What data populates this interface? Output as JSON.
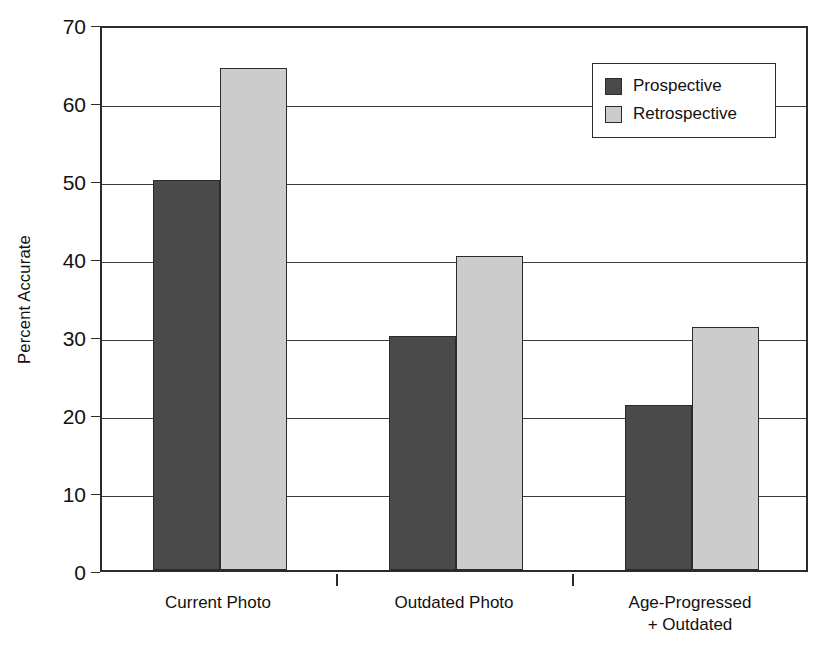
{
  "chart_data": {
    "type": "bar",
    "title": "",
    "subtitle": "",
    "xlabel": "",
    "ylabel": "Percent Accurate",
    "ylim": [
      0,
      70
    ],
    "yticks": [
      0,
      10,
      20,
      30,
      40,
      50,
      60,
      70
    ],
    "ytick_labels": [
      "0",
      "10",
      "20",
      "30",
      "40",
      "50",
      "60",
      "70"
    ],
    "grid": true,
    "grid_axis": "y",
    "legend_position": "top-right",
    "categories": [
      "Current Photo",
      "Outdated Photo",
      "Age-Progressed\n+ Outdated"
    ],
    "series": [
      {
        "name": "Prospective",
        "color": "#4a4a4a",
        "values": [
          50.0,
          30.0,
          21.2
        ]
      },
      {
        "name": "Retrospective",
        "color": "#cccccc",
        "values": [
          64.3,
          40.2,
          31.2
        ]
      }
    ]
  },
  "axis": {
    "y_title": "Percent Accurate"
  },
  "legend": {
    "entries": [
      {
        "label": "Prospective"
      },
      {
        "label": "Retrospective"
      }
    ]
  }
}
